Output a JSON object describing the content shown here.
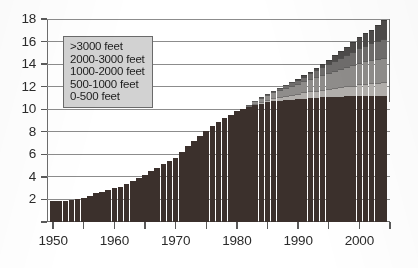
{
  "chart_data": {
    "type": "bar",
    "stacked": true,
    "title": "",
    "subtitle": "",
    "xlabel": "",
    "ylabel": "",
    "xlim": [
      1949,
      2005
    ],
    "ylim": [
      0,
      18
    ],
    "ytick_labels": [
      "0",
      "2",
      "4",
      "6",
      "8",
      "10",
      "12",
      "14",
      "16",
      "18"
    ],
    "ytick_values": [
      0,
      2,
      4,
      6,
      8,
      10,
      12,
      14,
      16,
      18
    ],
    "ytick_step": 2,
    "xtick_values": [
      1950,
      1955,
      1960,
      1965,
      1970,
      1975,
      1980,
      1985,
      1990,
      1995,
      2000,
      2005
    ],
    "xtick_labels_shown": [
      "1950",
      "1960",
      "1970",
      "1980",
      "1990",
      "2000"
    ],
    "xtick_label_values": [
      1950,
      1960,
      1970,
      1980,
      1990,
      2000
    ],
    "grid": true,
    "grid_axis": "y",
    "legend_position": "upper-left",
    "legend_entries": [
      ">3000 feet",
      "2000-3000 feet",
      "1000-2000 feet",
      "500-1000 feet",
      "0-500 feet"
    ],
    "series_order_bottom_to_top": [
      "0-500 feet",
      "500-1000 feet",
      "1000-2000 feet",
      "2000-3000 feet",
      ">3000 feet"
    ],
    "colors": {
      "0-500 feet": "#3b302c",
      "500-1000 feet": "#b3b0ad",
      "1000-2000 feet": "#8f8d8b",
      "2000-3000 feet": "#6f6d6c",
      ">3000 feet": "#4d4b4a",
      "legend_background": "#d2d2d2",
      "legend_border": "#6a6a6a",
      "axis": "#6d6d6d",
      "gridline": "#8c8c8c",
      "text": "#2b2b2b",
      "background": "#ffffff"
    },
    "x": [
      1950,
      1951,
      1952,
      1953,
      1954,
      1955,
      1956,
      1957,
      1958,
      1959,
      1960,
      1961,
      1962,
      1963,
      1964,
      1965,
      1966,
      1967,
      1968,
      1969,
      1970,
      1971,
      1972,
      1973,
      1974,
      1975,
      1976,
      1977,
      1978,
      1979,
      1980,
      1981,
      1982,
      1983,
      1984,
      1985,
      1986,
      1987,
      1988,
      1989,
      1990,
      1991,
      1992,
      1993,
      1994,
      1995,
      1996,
      1997,
      1998,
      1999,
      2000,
      2001,
      2002,
      2003,
      2004
    ],
    "series": [
      {
        "name": "0-500 feet",
        "values": [
          1.9,
          1.9,
          1.9,
          1.95,
          2.0,
          2.1,
          2.3,
          2.6,
          2.7,
          2.8,
          3.0,
          3.1,
          3.4,
          3.6,
          3.9,
          4.2,
          4.5,
          4.8,
          5.1,
          5.4,
          5.7,
          6.2,
          6.7,
          7.2,
          7.6,
          8.1,
          8.5,
          8.9,
          9.2,
          9.5,
          9.8,
          10.0,
          10.2,
          10.35,
          10.5,
          10.6,
          10.7,
          10.75,
          10.8,
          10.85,
          10.9,
          10.95,
          11.0,
          11.0,
          11.05,
          11.05,
          11.1,
          11.1,
          11.15,
          11.15,
          11.2,
          11.2,
          11.2,
          11.2,
          11.2
        ]
      },
      {
        "name": "500-1000 feet",
        "values": [
          0,
          0,
          0,
          0,
          0,
          0,
          0,
          0,
          0,
          0,
          0,
          0,
          0,
          0,
          0,
          0,
          0,
          0,
          0,
          0,
          0,
          0,
          0,
          0,
          0,
          0,
          0,
          0,
          0,
          0,
          0,
          0,
          0.1,
          0.15,
          0.2,
          0.25,
          0.3,
          0.35,
          0.4,
          0.45,
          0.5,
          0.55,
          0.6,
          0.65,
          0.7,
          0.75,
          0.8,
          0.85,
          0.9,
          0.95,
          1.0,
          1.05,
          1.1,
          1.15,
          1.2
        ]
      },
      {
        "name": "1000-2000 feet",
        "values": [
          0,
          0,
          0,
          0,
          0,
          0,
          0,
          0,
          0,
          0,
          0,
          0,
          0,
          0,
          0,
          0,
          0,
          0,
          0,
          0,
          0,
          0,
          0,
          0,
          0,
          0,
          0,
          0,
          0,
          0,
          0,
          0,
          0.1,
          0.2,
          0.3,
          0.4,
          0.5,
          0.6,
          0.7,
          0.8,
          0.9,
          1.0,
          1.1,
          1.2,
          1.3,
          1.4,
          1.5,
          1.6,
          1.7,
          1.8,
          1.9,
          2.0,
          2.05,
          2.1,
          2.15
        ]
      },
      {
        "name": "2000-3000 feet",
        "values": [
          0,
          0,
          0,
          0,
          0,
          0,
          0,
          0,
          0,
          0,
          0,
          0,
          0,
          0,
          0,
          0,
          0,
          0,
          0,
          0,
          0,
          0,
          0,
          0,
          0,
          0,
          0,
          0,
          0,
          0,
          0,
          0,
          0,
          0,
          0.05,
          0.1,
          0.15,
          0.2,
          0.25,
          0.3,
          0.35,
          0.4,
          0.5,
          0.6,
          0.7,
          0.8,
          0.9,
          1.0,
          1.1,
          1.2,
          1.3,
          1.4,
          1.5,
          1.6,
          1.7
        ]
      },
      {
        "name": ">3000 feet",
        "values": [
          0,
          0,
          0,
          0,
          0,
          0,
          0,
          0,
          0,
          0,
          0,
          0,
          0,
          0,
          0,
          0,
          0,
          0,
          0,
          0,
          0,
          0,
          0,
          0,
          0,
          0,
          0,
          0,
          0,
          0,
          0,
          0,
          0,
          0,
          0,
          0,
          0,
          0,
          0,
          0,
          0.05,
          0.1,
          0.15,
          0.2,
          0.3,
          0.4,
          0.5,
          0.6,
          0.7,
          0.85,
          1.0,
          1.1,
          1.2,
          1.4,
          1.65
        ]
      }
    ],
    "totals": [
      1.9,
      1.9,
      1.9,
      1.95,
      2.0,
      2.1,
      2.3,
      2.6,
      2.7,
      2.8,
      3.0,
      3.1,
      3.4,
      3.6,
      3.9,
      4.2,
      4.5,
      4.8,
      5.1,
      5.4,
      5.7,
      6.2,
      6.7,
      7.2,
      7.6,
      8.1,
      8.5,
      8.9,
      9.2,
      9.5,
      9.8,
      10.0,
      10.4,
      10.7,
      11.05,
      11.35,
      11.65,
      11.9,
      12.15,
      12.4,
      12.7,
      13.0,
      13.35,
      13.65,
      14.05,
      14.4,
      14.8,
      15.15,
      15.55,
      15.95,
      16.4,
      16.75,
      17.05,
      17.45,
      17.9
    ]
  }
}
